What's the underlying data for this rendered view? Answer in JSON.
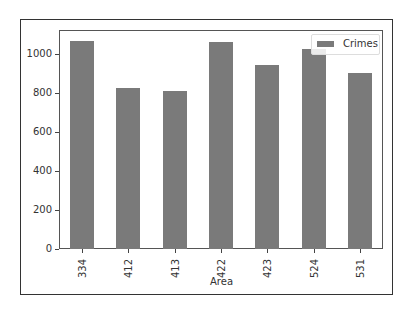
{
  "chart_data": {
    "type": "bar",
    "title": "",
    "xlabel": "Area",
    "ylabel": "",
    "categories": [
      "334",
      "412",
      "413",
      "422",
      "423",
      "524",
      "531"
    ],
    "series": [
      {
        "name": "Crimes",
        "values": [
          1067,
          826,
          810,
          1062,
          944,
          1026,
          903
        ],
        "color": "#7a7a7a"
      }
    ],
    "ylim": [
      0,
      1120
    ],
    "yticks": [
      "0",
      "200",
      "400",
      "600",
      "800",
      "1000"
    ],
    "grid": false,
    "legend_position": "upper right"
  },
  "legend": {
    "label": "Crimes"
  },
  "axes": {
    "xlabel": "Area"
  }
}
